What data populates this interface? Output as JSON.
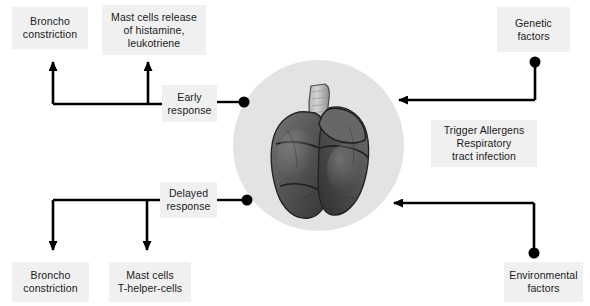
{
  "diagram": {
    "center": {
      "image_name": "lung-specimen-photograph",
      "background_color": "#e3e3e3",
      "description": "Grayscale photograph of an anatomical lung specimen with trachea"
    },
    "boxes": [
      {
        "id": "broncho-constriction-early",
        "text": "Broncho\nconstriction",
        "x": 12,
        "y": 7,
        "w": 76,
        "h": 42
      },
      {
        "id": "mast-cells-release",
        "text": "Mast cells release\nof histamine,\nleukotriene",
        "x": 102,
        "y": 5,
        "w": 104,
        "h": 50
      },
      {
        "id": "early-response",
        "text": "Early\nresponse",
        "x": 162,
        "y": 85,
        "w": 55,
        "h": 37
      },
      {
        "id": "delayed-response",
        "text": "Delayed\nresponse",
        "x": 160,
        "y": 182,
        "w": 57,
        "h": 36
      },
      {
        "id": "broncho-constriction-delayed",
        "text": "Broncho\nconstriction",
        "x": 12,
        "y": 262,
        "w": 77,
        "h": 40
      },
      {
        "id": "mast-cells-t-helper",
        "text": "Mast cells\nT-helper-cells",
        "x": 109,
        "y": 262,
        "w": 82,
        "h": 40
      },
      {
        "id": "genetic-factors",
        "text": "Genetic\nfactors",
        "x": 497,
        "y": 7,
        "w": 73,
        "h": 45
      },
      {
        "id": "trigger-allergens",
        "text": "Trigger Allergens\nRespiratory\ntract infection",
        "x": 431,
        "y": 120,
        "w": 106,
        "h": 47
      },
      {
        "id": "environmental-factors",
        "text": "Environmental\nfactors",
        "x": 504,
        "y": 262,
        "w": 79,
        "h": 40
      }
    ],
    "connectors": {
      "line_color": "#000000",
      "early_response_dot": {
        "x": 244,
        "y": 102
      },
      "delayed_response_dot": {
        "x": 247,
        "y": 200
      },
      "genetic_factors_dot": {
        "x": 535,
        "y": 62
      },
      "environmental_factors_dot": {
        "x": 534,
        "y": 253
      }
    }
  }
}
